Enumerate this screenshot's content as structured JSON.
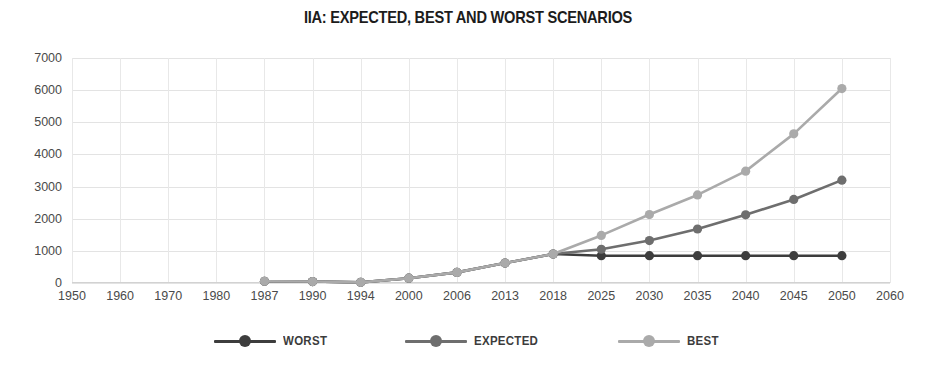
{
  "chart_data": {
    "type": "line",
    "title": "IIA: EXPECTED, BEST AND WORST SCENARIOS",
    "xlabel": "",
    "ylabel": "",
    "ylim": [
      0,
      7000
    ],
    "ytick_step": 1000,
    "yticks": [
      "7000",
      "6000",
      "5000",
      "4000",
      "3000",
      "2000",
      "1000",
      "0"
    ],
    "grid": true,
    "legend_position": "bottom-center",
    "categories": [
      "1950",
      "1960",
      "1970",
      "1980",
      "1987",
      "1990",
      "1994",
      "2000",
      "2006",
      "2013",
      "2018",
      "2025",
      "2030",
      "2035",
      "2040",
      "2045",
      "2050",
      "2060"
    ],
    "series": [
      {
        "name": "WORST",
        "color": "#3d3d3d",
        "values": [
          null,
          null,
          null,
          null,
          55,
          45,
          20,
          150,
          330,
          620,
          900,
          850,
          850,
          850,
          850,
          850,
          850,
          null
        ]
      },
      {
        "name": "EXPECTED",
        "color": "#6e6e6e",
        "values": [
          null,
          null,
          null,
          null,
          55,
          45,
          20,
          150,
          330,
          620,
          900,
          1050,
          1320,
          1680,
          2120,
          2600,
          3200,
          null
        ]
      },
      {
        "name": "BEST",
        "color": "#aaaaaa",
        "values": [
          null,
          null,
          null,
          null,
          55,
          45,
          20,
          150,
          330,
          620,
          900,
          1480,
          2130,
          2740,
          3480,
          4640,
          6050,
          null
        ]
      }
    ]
  },
  "legend": {
    "items": [
      {
        "label": "WORST",
        "color": "#3d3d3d",
        "icon": "line-marker-icon"
      },
      {
        "label": "EXPECTED",
        "color": "#6e6e6e",
        "icon": "line-marker-icon"
      },
      {
        "label": "BEST",
        "color": "#aaaaaa",
        "icon": "line-marker-icon"
      }
    ]
  }
}
